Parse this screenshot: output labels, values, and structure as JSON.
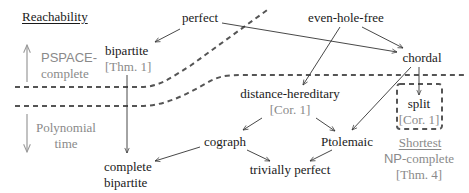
{
  "legend": {
    "reachability_heading": "Reachability",
    "pspace": {
      "prefix": "PSPACE-",
      "suffix": "complete"
    },
    "polynomial": {
      "line1": "Polynomial",
      "line2": "time"
    },
    "shortest_heading": "Shortest",
    "np": {
      "prefix": "NP",
      "suffix": "-complete"
    },
    "np_ref": "[Thm. 4]"
  },
  "nodes": {
    "perfect": {
      "label": "perfect"
    },
    "even_hole_free": {
      "label": "even-hole-free"
    },
    "bipartite": {
      "label": "bipartite",
      "ref": "[Thm. 1]"
    },
    "chordal": {
      "label": "chordal"
    },
    "distance_hereditary": {
      "label": "distance-hereditary",
      "ref": "[Cor. 1]"
    },
    "split": {
      "label": "split",
      "ref": "[Cor. 1]"
    },
    "cograph": {
      "label": "cograph"
    },
    "ptolemaic": {
      "label": "Ptolemaic"
    },
    "complete_bipartite": {
      "line1": "complete",
      "line2": "bipartite"
    },
    "trivially_perfect": {
      "label": "trivially perfect"
    }
  },
  "edges": [
    {
      "from": "perfect",
      "to": "bipartite"
    },
    {
      "from": "perfect",
      "to": "chordal"
    },
    {
      "from": "even_hole_free",
      "to": "distance_hereditary"
    },
    {
      "from": "even_hole_free",
      "to": "chordal"
    },
    {
      "from": "bipartite",
      "to": "complete_bipartite"
    },
    {
      "from": "chordal",
      "to": "split"
    },
    {
      "from": "chordal",
      "to": "ptolemaic"
    },
    {
      "from": "distance_hereditary",
      "to": "cograph"
    },
    {
      "from": "distance_hereditary",
      "to": "ptolemaic"
    },
    {
      "from": "cograph",
      "to": "complete_bipartite"
    },
    {
      "from": "cograph",
      "to": "trivially_perfect"
    },
    {
      "from": "ptolemaic",
      "to": "trivially_perfect"
    }
  ],
  "colors": {
    "ink": "#1a1a1a",
    "muted": "#8a8a8a",
    "boundary": "#555555"
  }
}
